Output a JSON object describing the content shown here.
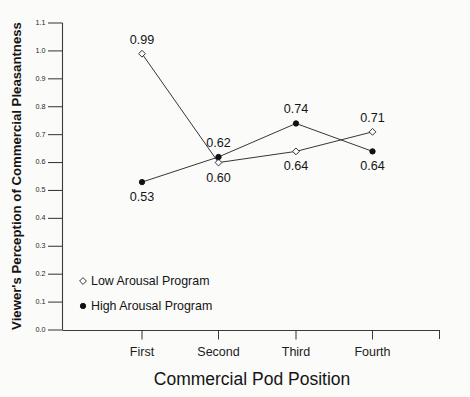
{
  "chart_data": {
    "type": "line",
    "title": "",
    "xlabel": "Commercial Pod Position",
    "ylabel": "Viewer's Perception of Commercial Pleasantness",
    "categories": [
      "First",
      "Second",
      "Third",
      "Fourth"
    ],
    "ylim": [
      0.0,
      1.1
    ],
    "ytick_labels": [
      "0.0",
      "0.1",
      "0.2",
      "0.3",
      "0.4",
      "0.5",
      "0.6",
      "0.7",
      "0.8",
      "0.9",
      "1.0",
      "1.1"
    ],
    "ytick_values": [
      0.0,
      0.1,
      0.2,
      0.3,
      0.4,
      0.5,
      0.6,
      0.7,
      0.8,
      0.9,
      1.0,
      1.1
    ],
    "grid": false,
    "legend_position": "lower-left-inside",
    "series": [
      {
        "name": "Low Arousal Program",
        "marker": "open-diamond",
        "values": [
          0.99,
          0.6,
          0.64,
          0.71
        ],
        "value_labels": [
          "0.99",
          "0.60",
          "0.64",
          "0.71"
        ],
        "label_positions": [
          "above",
          "below",
          "below",
          "above"
        ]
      },
      {
        "name": "High Arousal Program",
        "marker": "filled-circle",
        "values": [
          0.53,
          0.62,
          0.74,
          0.64
        ],
        "value_labels": [
          "0.53",
          "0.62",
          "0.74",
          "0.64"
        ],
        "label_positions": [
          "below",
          "above",
          "above",
          "below"
        ]
      }
    ]
  },
  "legend": {
    "items": [
      {
        "label": "Low Arousal Program",
        "marker": "open-diamond"
      },
      {
        "label": "High Arousal Program",
        "marker": "filled-circle"
      }
    ]
  },
  "colors": {
    "background": "#fbfbfa",
    "axis": "#3a3a3a",
    "line": "#2b2b2b",
    "text": "#141414",
    "marker_fill": "#111111"
  }
}
